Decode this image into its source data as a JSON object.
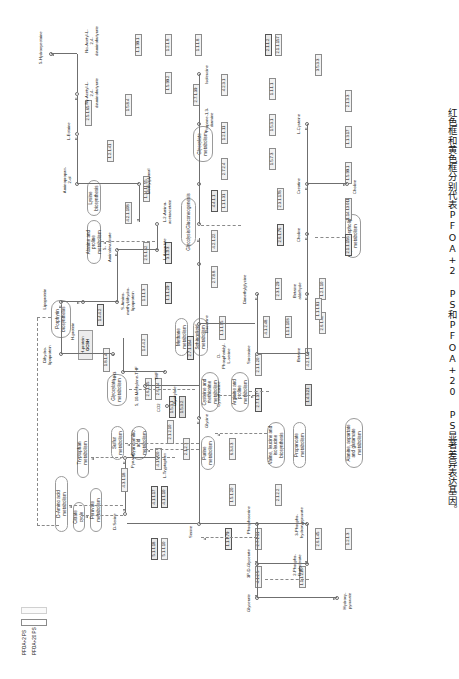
{
  "figure": {
    "caption": "红色框和黄色框分别代表PFOA+2 PS和PFOA+20 PS显著差异表达基因。",
    "orientation": "rotated-90"
  },
  "legend": {
    "items": [
      {
        "label": "PFOA+2 PS",
        "swatch_color": "#ffffff",
        "border": "#8a8a8a"
      },
      {
        "label": "PFOA+20 PS",
        "swatch_color": "#fafafa",
        "border": "#c9c9c9"
      }
    ]
  },
  "pathway": {
    "title": "Glycine, serine and threonine metabolism",
    "map_nodes": [
      {
        "id": "m1",
        "label": "D-Amino acid metabolism"
      },
      {
        "id": "m2",
        "label": "Citrate cycle"
      },
      {
        "id": "m3",
        "label": "Pyruvate metabolism"
      },
      {
        "id": "m4",
        "label": "Tryptophan metabolism"
      },
      {
        "id": "m5",
        "label": "Sulfur metabolism"
      },
      {
        "id": "m6",
        "label": "Cyanoamino acid metabolism"
      },
      {
        "id": "m7",
        "label": "Glyoxylate metabolism"
      },
      {
        "id": "m8",
        "label": "Glyoxylate metabolism"
      },
      {
        "id": "m9",
        "label": "Porphyrin biosynthesis"
      },
      {
        "id": "m10",
        "label": "Alanine and proline metabolism"
      },
      {
        "id": "m11",
        "label": "Lysine biosynthesis"
      },
      {
        "id": "m12",
        "label": "Glycolysis/Gluconeogenesis"
      },
      {
        "id": "m13",
        "label": "Methane metabolism"
      },
      {
        "id": "m14",
        "label": "Sphingolipid metabolism"
      },
      {
        "id": "m15",
        "label": "Cysteine and methionine metabolism"
      },
      {
        "id": "m16",
        "label": "Arginine and proline metabolism"
      },
      {
        "id": "m17",
        "label": "Purine metabolism"
      },
      {
        "id": "m18",
        "label": "Valine, leucine and isoleucine biosynthesis"
      },
      {
        "id": "m19",
        "label": "Propanoate metabolism"
      },
      {
        "id": "m20",
        "label": "Alanine, aspartate and glutamate metabolism"
      },
      {
        "id": "m21",
        "label": "Glycerophospholipid metabolism"
      }
    ],
    "compounds": [
      {
        "id": "c1",
        "label": "D-Serine"
      },
      {
        "id": "c2",
        "label": "Pyruvate"
      },
      {
        "id": "c3",
        "label": "L-Tryptophan"
      },
      {
        "id": "c4",
        "label": "Serine"
      },
      {
        "id": "c5",
        "label": "Glycine"
      },
      {
        "id": "c6",
        "label": "Glyoxylate"
      },
      {
        "id": "c7",
        "label": "5, 10-Methylene-THF"
      },
      {
        "id": "c8",
        "label": "NH3"
      },
      {
        "id": "c9",
        "label": "THF"
      },
      {
        "id": "c10",
        "label": "CO2"
      },
      {
        "id": "c11",
        "label": "Dihydro-lipoprotein"
      },
      {
        "id": "c12",
        "label": "Lipoprotein"
      },
      {
        "id": "c13",
        "label": "S-Amino-methyldihydro-lipoprotein"
      },
      {
        "id": "c14",
        "label": "H-protein"
      },
      {
        "id": "c15",
        "label": "5-Aminolevulinate"
      },
      {
        "id": "c16",
        "label": "2-Aminoacetone"
      },
      {
        "id": "c17",
        "label": "Aminoacetone"
      },
      {
        "id": "c18",
        "label": "Aminopropan-2-ol"
      },
      {
        "id": "c19",
        "label": "Methylglyoxal"
      },
      {
        "id": "c20",
        "label": "L-2-Amino-acetoacetate"
      },
      {
        "id": "c21",
        "label": "L-Aspartate"
      },
      {
        "id": "c22",
        "label": "Threonine"
      },
      {
        "id": "c23",
        "label": "Propane-1,3-diamine"
      },
      {
        "id": "c24",
        "label": "Isoleucine"
      },
      {
        "id": "c25",
        "label": "L-Lysine"
      },
      {
        "id": "c26",
        "label": "5-Hydroxyectoine"
      },
      {
        "id": "c27",
        "label": "L-Ectoine"
      },
      {
        "id": "c28",
        "label": "Nγ-Acetyl-L-2,4-diaminobutyrate"
      },
      {
        "id": "c29",
        "label": "Nα-Acetyl-L-2,4-diaminobutyrate"
      },
      {
        "id": "c30",
        "label": "L-4-Aspartyl-semialdehyde"
      },
      {
        "id": "c31",
        "label": "L-2,4-Diamino-butanoate"
      },
      {
        "id": "c32",
        "label": "L-Aspartate-4-semialdehyde"
      },
      {
        "id": "c33",
        "label": "2-Oxobutanoate"
      },
      {
        "id": "c34",
        "label": "Sarcosine"
      },
      {
        "id": "c35",
        "label": "Dimethylglycine"
      },
      {
        "id": "c36",
        "label": "Betaine"
      },
      {
        "id": "c37",
        "label": "Betaine aldehyde"
      },
      {
        "id": "c38",
        "label": "Choline"
      },
      {
        "id": "c39",
        "label": "Creatine"
      },
      {
        "id": "c40",
        "label": "L-Cysteine"
      },
      {
        "id": "c41",
        "label": "Guanidinoacetate"
      },
      {
        "id": "c42",
        "label": "Cystathionine"
      },
      {
        "id": "c43",
        "label": "O-Phosphatidyl-L-serine"
      },
      {
        "id": "c44",
        "label": "Phosphoserine"
      },
      {
        "id": "c45",
        "label": "3-Phospho-hydroxypyruvate"
      },
      {
        "id": "c46",
        "label": "3P-D-Glycerate"
      },
      {
        "id": "c47",
        "label": "2-Phospho-D-glycerate"
      },
      {
        "id": "c48",
        "label": "Glycerate"
      },
      {
        "id": "c49",
        "label": "Hydroxy-pyruvate"
      },
      {
        "id": "c50",
        "label": "O-Acetyl-L-serine"
      },
      {
        "id": "c51",
        "label": "L-Allo-threonine"
      }
    ],
    "gene_box": {
      "label_top": "H-protein",
      "label_bottom": "GCSH"
    },
    "ec_numbers": [
      "5.1.1.18",
      "5.1.1.10",
      "4.3.1.18",
      "4.1.1.17",
      "4.1.1.10",
      "4.1.1.20",
      "1.1.1.381",
      "2.1.2.1",
      "1.4.4.2",
      "2.6.1.44",
      "2.6.1.45",
      "2.6.1.4",
      "1.4.1.1",
      "1.5.3.1",
      "1.5.3.2",
      "2.1.2.10",
      "1.8.1.4",
      "1.4.4.2",
      "2.7.1.164",
      "1.1.1.95",
      "1.1.1.29",
      "1.1.1.81",
      "3.1.3.3",
      "2.6.1.52",
      "2.7.8.8",
      "4.2.1.22",
      "4.4.1.1",
      "1.1.1.31",
      "2.7.2.4",
      "1.2.1.11",
      "1.1.1.3",
      "2.7.1.39",
      "4.2.3.1",
      "2.7.1.37",
      "2.1.1.20",
      "4.1.2.48",
      "1.1.1.103",
      "2.3.1.29",
      "1.4.3.21",
      "4.2.1.49",
      "2.6.1.42",
      "1.2.1.10",
      "2.6.1.76",
      "2.3.1.178",
      "4.2.1.108",
      "1.14.11.55",
      "1.2.1.41",
      "2.5.1.65",
      "1.5.8.4",
      "1.5.7.3",
      "1.5.3.1",
      "1.1.1.1",
      "2.1.1.156",
      "1.14.13.011",
      "1.5.99.1",
      "1.1.3.17",
      "2.1.3.3",
      "3.5.3.3",
      "2.1.1.2",
      "2.1.1.157",
      "1.1.1.8",
      "1.2.1.8",
      "1.1.99.1",
      "1.5.99.2",
      "1.4.4.2",
      "6.3.4.3",
      "1.5.1.20",
      "2.1.2.2",
      "1.1.1.79",
      "2.7.1.31",
      "4.1.2.5",
      "1.1.1.215",
      "2.6.1.45",
      "1.2.1.3",
      "2.3.1.37"
    ]
  }
}
